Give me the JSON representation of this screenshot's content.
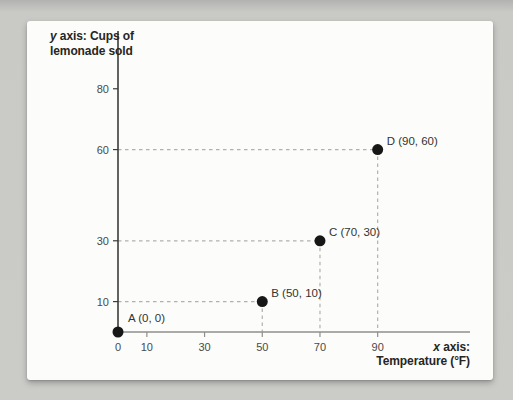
{
  "page": {
    "background": "#c9c9c6"
  },
  "card": {
    "background": "#fcfcfa"
  },
  "chart_data": {
    "type": "scatter",
    "title": "",
    "y_axis_title": {
      "italic_var": "y",
      "text": " axis: Cups of",
      "line2": "lemonade sold"
    },
    "x_axis_title": {
      "italic_var": "x",
      "text": " axis:",
      "line2": "Temperature (°F)"
    },
    "x_ticks": [
      0,
      10,
      30,
      50,
      70,
      90
    ],
    "y_ticks": [
      10,
      30,
      60,
      80
    ],
    "xlim": [
      0,
      122
    ],
    "ylim": [
      0,
      99
    ],
    "grid": "off",
    "legend": "none",
    "guide_style": "dashed",
    "points": [
      {
        "name": "A",
        "x": 0,
        "y": 0,
        "label": "A (0, 0)"
      },
      {
        "name": "B",
        "x": 50,
        "y": 10,
        "label": "B (50, 10)"
      },
      {
        "name": "C",
        "x": 70,
        "y": 30,
        "label": "C (70, 30)"
      },
      {
        "name": "D",
        "x": 90,
        "y": 60,
        "label": "D (90, 60)"
      }
    ],
    "colors": {
      "y_axis": "#3b3b3b",
      "x_axis": "#8f8f8c",
      "guide": "#b0b0ad",
      "point": "#171717",
      "tick_text": "#4a4a48",
      "title_text": "#262624"
    }
  }
}
